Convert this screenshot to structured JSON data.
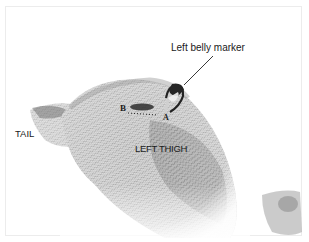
{
  "figure": {
    "labels": {
      "belly_marker": "Left belly marker",
      "tail": "TAIL",
      "thigh": "LEFT THIGH",
      "point_b": "B",
      "point_a": "A"
    },
    "colors": {
      "background": "#ffffff",
      "knit_light": "#e6e6e6",
      "knit_mid": "#a8a8a8",
      "knit_dark": "#4a4a4a",
      "marker": "#2a2a2a",
      "text": "#1a1a1a"
    }
  }
}
